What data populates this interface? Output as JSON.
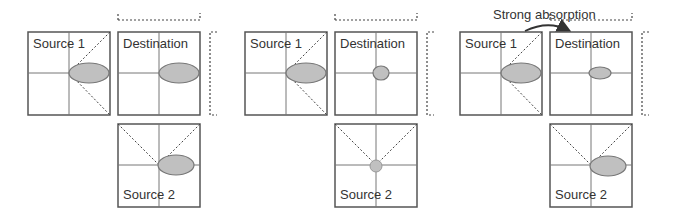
{
  "colors": {
    "border": "#555555",
    "axis": "#777777",
    "dash": "#444444",
    "lobe_fill": "#c0c0c0",
    "lobe_stroke": "#777777",
    "background": "#ffffff"
  },
  "annotation": {
    "label": "Strong absorption"
  },
  "groups": [
    {
      "source1": {
        "label": "Source 1"
      },
      "destination": {
        "label": "Destination"
      },
      "source2": {
        "label": "Source 2"
      }
    },
    {
      "source1": {
        "label": "Source 1"
      },
      "destination": {
        "label": "Destination"
      },
      "source2": {
        "label": "Source 2"
      }
    },
    {
      "source1": {
        "label": "Source 1"
      },
      "destination": {
        "label": "Destination"
      },
      "source2": {
        "label": "Source 2"
      }
    }
  ]
}
